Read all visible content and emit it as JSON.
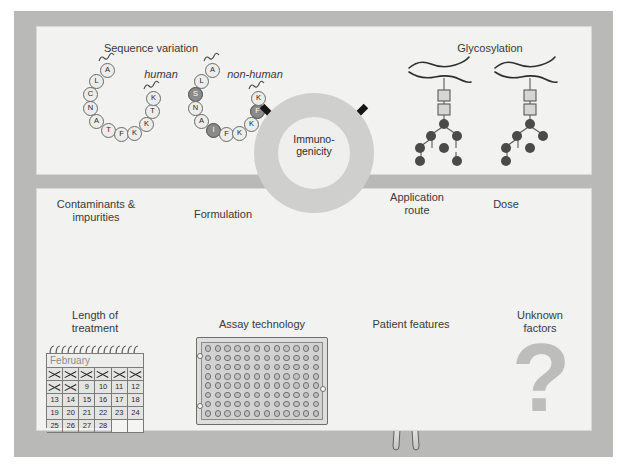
{
  "figure": {
    "frame_color": "#b9b9b7",
    "panel_color": "#f2f2f0",
    "background": "#ffffff"
  },
  "hub": {
    "label": "Immuno-\ngenicity",
    "ring_color": "#cfcfcd",
    "core_color": "#efefed",
    "arrow_count": 4,
    "arrow_color": "#151515",
    "arrow_directions": [
      "top-left",
      "top-right",
      "bottom-left",
      "bottom-right"
    ]
  },
  "top_panel": {
    "sequence_variation": {
      "title": "Sequence variation",
      "human": {
        "label": "human",
        "left_arm": [
          "A",
          "L",
          "C",
          "N",
          "A",
          "T",
          "F",
          "K"
        ],
        "right_arm": [
          "K",
          "T",
          "K"
        ],
        "variants": []
      },
      "non_human": {
        "label": "non-human",
        "left_arm": [
          "A",
          "L",
          "S",
          "N",
          "A",
          "I",
          "F",
          "K"
        ],
        "right_arm": [
          "K",
          "F",
          "K"
        ],
        "variants": [
          "S",
          "I",
          "F"
        ],
        "variant_color": "#8a8a88"
      }
    },
    "glycosylation": {
      "title": "Glycosylation",
      "structures": 2,
      "square_residue_color": "#d5d5d3",
      "circle_residue_color": "#4a4a48",
      "squares_per_structure": 2,
      "circles_per_structure": 7
    }
  },
  "bottom_panel": {
    "items": [
      {
        "key": "contaminants",
        "label": "Contaminants &\nimpurities",
        "icon": "mountain-with-dots-icon"
      },
      {
        "key": "formulation",
        "label": "Formulation",
        "icon": "two-bell-curves-icon"
      },
      {
        "key": "application_route",
        "label": "Application\nroute",
        "icon": "arm-with-syringe-icon"
      },
      {
        "key": "dose",
        "label": "Dose",
        "icon": "spoon-and-jar-icon"
      },
      {
        "key": "length_of_treatment",
        "label": "Length of\ntreatment",
        "icon": "calendar-icon"
      },
      {
        "key": "assay_technology",
        "label": "Assay technology",
        "icon": "microplate-icon"
      },
      {
        "key": "patient_features",
        "label": "Patient features",
        "icon": "patient-figure-icon"
      },
      {
        "key": "unknown_factors",
        "label": "Unknown\nfactors",
        "icon": "question-mark-icon"
      }
    ]
  },
  "calendar": {
    "month": "February",
    "columns": 6,
    "rows": 5,
    "days": [
      [
        "1",
        "2",
        "3",
        "4",
        "5",
        "6"
      ],
      [
        "7",
        "8",
        "9",
        "10",
        "11",
        "12"
      ],
      [
        "13",
        "14",
        "15",
        "16",
        "17",
        "18"
      ],
      [
        "19",
        "20",
        "21",
        "22",
        "23",
        "24"
      ],
      [
        "25",
        "26",
        "27",
        "28",
        "",
        ""
      ]
    ],
    "crossed_out": [
      "1",
      "2",
      "3",
      "4",
      "5",
      "6",
      "7",
      "8"
    ]
  },
  "microplate": {
    "columns": 12,
    "rows": 8,
    "total_wells": 96,
    "well_color": "#c2c2c2",
    "notch_count": 3
  },
  "unknown": {
    "glyph": "?",
    "color": "#bdbdbb"
  }
}
